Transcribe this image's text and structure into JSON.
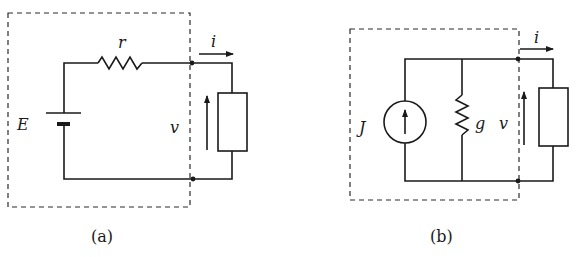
{
  "figure": {
    "panels": [
      {
        "id": "a",
        "caption": "(a)",
        "labels": {
          "source": "E",
          "resistor": "r",
          "voltage": "v",
          "current": "i"
        },
        "components": [
          "voltage-source",
          "series-resistor",
          "load"
        ]
      },
      {
        "id": "b",
        "caption": "(b)",
        "labels": {
          "source": "J",
          "conductance": "g",
          "voltage": "v",
          "current": "i"
        },
        "components": [
          "current-source",
          "shunt-conductance",
          "load"
        ]
      }
    ],
    "colors": {
      "ink": "#1a1a1a",
      "background": "#ffffff"
    }
  }
}
